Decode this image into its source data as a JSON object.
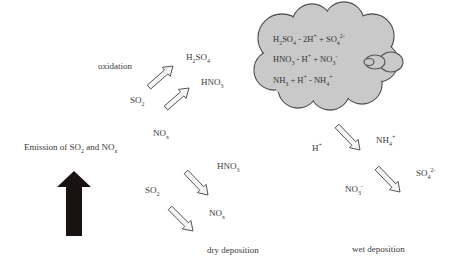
{
  "cloud": {
    "equations": [
      {
        "parts": [
          [
            "H",
            ""
          ],
          [
            "2",
            "sub"
          ],
          [
            "SO",
            ""
          ],
          [
            "4",
            "sub"
          ],
          [
            " - 2H",
            ""
          ],
          [
            "+",
            "sup"
          ],
          [
            " + SO",
            ""
          ],
          [
            "4",
            "sub"
          ],
          [
            "2-",
            "sup"
          ]
        ]
      },
      {
        "parts": [
          [
            "HNO",
            ""
          ],
          [
            "3",
            "sub"
          ],
          [
            " - H",
            ""
          ],
          [
            "+",
            "sup"
          ],
          [
            " + NO",
            ""
          ],
          [
            "3",
            "sub"
          ],
          [
            "-",
            "sup"
          ]
        ]
      },
      {
        "parts": [
          [
            "NH",
            ""
          ],
          [
            "3",
            "sub"
          ],
          [
            " + H",
            ""
          ],
          [
            "+",
            "sup"
          ],
          [
            " - NH",
            ""
          ],
          [
            "4",
            "sub"
          ],
          [
            "+",
            "sup"
          ]
        ]
      }
    ],
    "fill_color": "#c9c9c9",
    "outline_color": "#555555"
  },
  "labels": {
    "oxidation": "oxidation",
    "emission": {
      "parts": [
        [
          "Emission of SO",
          ""
        ],
        [
          "2",
          "sub"
        ],
        [
          " and NO",
          ""
        ],
        [
          "x",
          "sub"
        ]
      ]
    },
    "dry_deposition": "dry deposition",
    "wet_deposition": "wet deposition"
  },
  "species": {
    "ox_h2so4": {
      "parts": [
        [
          "H",
          ""
        ],
        [
          "2",
          "sub"
        ],
        [
          "SO",
          ""
        ],
        [
          "4",
          "sub"
        ]
      ]
    },
    "ox_hno3": {
      "parts": [
        [
          "HNO",
          ""
        ],
        [
          "3",
          "sub"
        ]
      ]
    },
    "ox_so2": {
      "parts": [
        [
          "SO",
          ""
        ],
        [
          "2",
          "sub"
        ]
      ]
    },
    "ox_nox": {
      "parts": [
        [
          "NO",
          ""
        ],
        [
          "x",
          "sub"
        ]
      ]
    },
    "dry_hno3": {
      "parts": [
        [
          "HNO",
          ""
        ],
        [
          "3",
          "sub"
        ]
      ]
    },
    "dry_so2": {
      "parts": [
        [
          "SO",
          ""
        ],
        [
          "2",
          "sub"
        ]
      ]
    },
    "dry_nox": {
      "parts": [
        [
          "NO",
          ""
        ],
        [
          "x",
          "sub"
        ]
      ]
    },
    "wet_h": {
      "parts": [
        [
          "H",
          ""
        ],
        [
          "+",
          "sup"
        ]
      ]
    },
    "wet_nh4": {
      "parts": [
        [
          "NH",
          ""
        ],
        [
          "4",
          "sub"
        ],
        [
          "+",
          "sup"
        ]
      ]
    },
    "wet_so4": {
      "parts": [
        [
          "SO",
          ""
        ],
        [
          "4",
          "sub"
        ],
        [
          "2-",
          "sup"
        ]
      ]
    },
    "wet_no3": {
      "parts": [
        [
          "NO",
          ""
        ],
        [
          "3",
          "sub"
        ],
        [
          "-",
          "sup"
        ]
      ]
    }
  },
  "colors": {
    "emission_arrow": "#1a1113",
    "hollow_arrow_fill": "#f4f4f4",
    "hollow_arrow_stroke": "#555555",
    "text": "#3a3a3a"
  }
}
